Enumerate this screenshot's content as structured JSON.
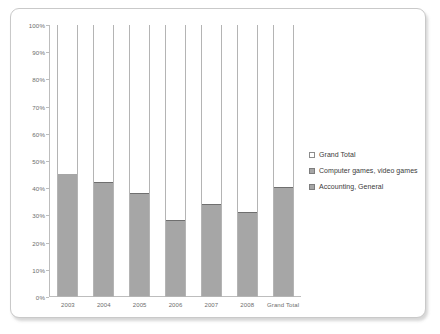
{
  "chart_data": {
    "type": "bar",
    "stacked": true,
    "stack_mode": "100%",
    "title": "",
    "subtitle": "",
    "xlabel": "",
    "ylabel": "",
    "ylim": [
      0,
      100
    ],
    "grid": false,
    "legend_position": "right",
    "categories": [
      "2003",
      "2004",
      "2005",
      "2006",
      "2007",
      "2008",
      "Grand Total"
    ],
    "y_ticks": [
      "0%",
      "10%",
      "20%",
      "30%",
      "40%",
      "50%",
      "60%",
      "70%",
      "80%",
      "90%",
      "100%"
    ],
    "y_tick_values": [
      0,
      10,
      20,
      30,
      40,
      50,
      60,
      70,
      80,
      90,
      100
    ],
    "series": [
      {
        "name": "Accounting, General",
        "color": "#a6a6a6",
        "values": [
          45,
          18,
          26,
          11,
          12,
          12,
          30
        ]
      },
      {
        "name": "Computer games, video games",
        "color": "#a6a6a6",
        "values": [
          0,
          24,
          12,
          17,
          22,
          19,
          10
        ]
      },
      {
        "name": "Grand Total",
        "color": "#ffffff",
        "values": [
          55,
          58,
          62,
          72,
          66,
          69,
          60
        ]
      }
    ],
    "legend_entries": [
      {
        "label": "Grand Total",
        "swatch": "hollow"
      },
      {
        "label": "Computer games, video games",
        "swatch": "filled"
      },
      {
        "label": "Accounting, General",
        "swatch": "filled"
      }
    ]
  },
  "colors": {
    "bar_fill": "#a6a6a6",
    "bar_outline": "#b4b4b4",
    "segment_divider": "#6f6f6f",
    "axis": "#bdbdbd",
    "tick_text": "#6d6d6d",
    "legend_text": "#3a3a3a",
    "frame_border": "#c9c9c9",
    "background": "#ffffff"
  }
}
